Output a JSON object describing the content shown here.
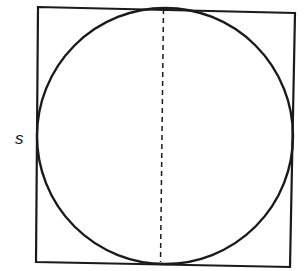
{
  "diagram": {
    "side_label": "s",
    "colors": {
      "stroke": "#1a1a1a",
      "background": "#ffffff"
    }
  }
}
